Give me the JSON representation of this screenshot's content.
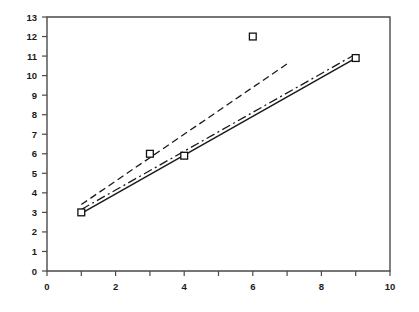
{
  "chart_data": {
    "type": "scatter",
    "title": "",
    "subtitle": "",
    "xlabel": "",
    "ylabel": "",
    "xlim": [
      0,
      10
    ],
    "ylim": [
      0,
      13
    ],
    "grid": false,
    "legend": "none",
    "x_ticks_major": [
      0,
      2,
      4,
      6,
      8,
      10
    ],
    "x_ticks_minor": [
      1,
      3,
      5,
      7,
      9
    ],
    "x_tick_labels": [
      "0",
      "2",
      "4",
      "6",
      "8",
      "10"
    ],
    "y_ticks_major": [
      0,
      1,
      2,
      3,
      4,
      5,
      6,
      7,
      8,
      9,
      10,
      11,
      12,
      13
    ],
    "y_tick_labels": [
      "0",
      "1",
      "2",
      "3",
      "4",
      "5",
      "6",
      "7",
      "8",
      "9",
      "10",
      "11",
      "12",
      "13"
    ],
    "points": {
      "name": "Observations",
      "marker": "square-open",
      "x": [
        1,
        3,
        4,
        6,
        9
      ],
      "y": [
        3.0,
        6.0,
        5.9,
        12.0,
        10.9
      ]
    },
    "series": [
      {
        "name": "Fit line A",
        "style": "dashed",
        "x": [
          1,
          7
        ],
        "y": [
          3.4,
          10.6
        ]
      },
      {
        "name": "Fit line B",
        "style": "dash-dot",
        "x": [
          1,
          9
        ],
        "y": [
          3.15,
          11.1
        ]
      },
      {
        "name": "Fit line C",
        "style": "solid",
        "x": [
          1,
          9
        ],
        "y": [
          2.95,
          10.9
        ]
      }
    ],
    "colors": {
      "axis": "#4a4a4a",
      "line": "#1a1a1a",
      "marker_fill": "#ffffff",
      "marker_stroke": "#111111",
      "background": "#ffffff"
    }
  }
}
